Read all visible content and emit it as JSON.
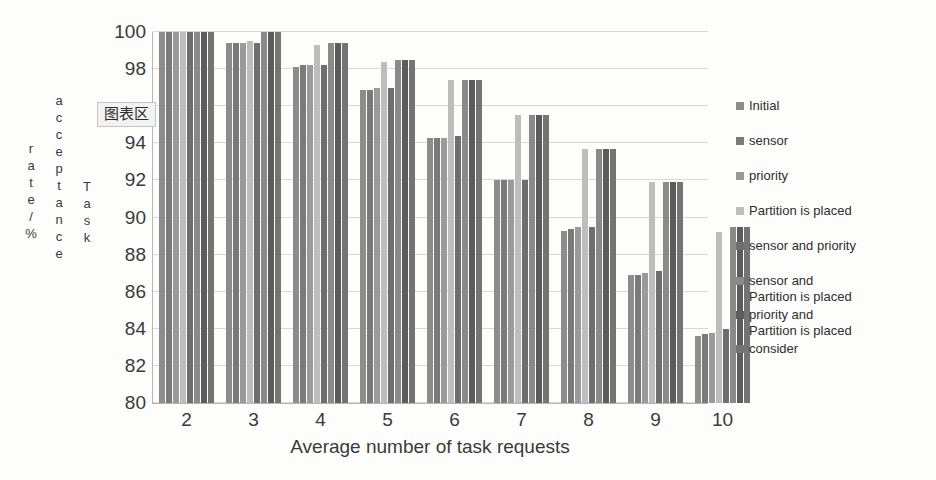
{
  "chart_data": {
    "type": "bar",
    "title": "",
    "xlabel": "Average number of task requests",
    "ylabel": "Task acceptance rate/%",
    "ylabel_parts": [
      "rate/%",
      "acceptance",
      "Task"
    ],
    "categories": [
      "2",
      "3",
      "4",
      "5",
      "6",
      "7",
      "8",
      "9",
      "10"
    ],
    "ylim": [
      80,
      100
    ],
    "yticks": [
      80,
      82,
      84,
      86,
      88,
      90,
      92,
      94,
      96,
      98,
      100
    ],
    "ytick_labels": [
      "80",
      "82",
      "84",
      "86",
      "88",
      "90",
      "92",
      "94",
      "",
      "98",
      "100"
    ],
    "grid": true,
    "legend_position": "right",
    "series": [
      {
        "name": "Initial",
        "color": "#8c8c8c",
        "values": [
          100,
          99.4,
          98.1,
          96.9,
          94.3,
          92.0,
          89.3,
          86.9,
          83.6
        ]
      },
      {
        "name": "sensor",
        "color": "#7a7a7a",
        "values": [
          100,
          99.4,
          98.2,
          96.9,
          94.3,
          92.0,
          89.4,
          86.9,
          83.7
        ]
      },
      {
        "name": "priority",
        "color": "#9a9a9a",
        "values": [
          100,
          99.4,
          98.2,
          97.0,
          94.3,
          92.0,
          89.5,
          87.0,
          83.8
        ]
      },
      {
        "name": "Partition is placed",
        "color": "#bdbdbd",
        "values": [
          100,
          99.5,
          99.3,
          98.4,
          97.4,
          95.5,
          93.7,
          91.9,
          89.2
        ]
      },
      {
        "name": "sensor and priority",
        "color": "#6e6e6e",
        "values": [
          100,
          99.4,
          98.2,
          97.0,
          94.4,
          92.0,
          89.5,
          87.1,
          84.0
        ]
      },
      {
        "name": "sensor and\nPartition is placed",
        "color": "#8a8a8a",
        "values": [
          100,
          100,
          99.4,
          98.5,
          97.4,
          95.5,
          93.7,
          91.9,
          89.5
        ]
      },
      {
        "name": "priority and\nPartition is placed",
        "color": "#5c5c5c",
        "values": [
          100,
          100,
          99.4,
          98.5,
          97.4,
          95.5,
          93.7,
          91.9,
          89.5
        ]
      },
      {
        "name": "consider",
        "color": "#747474",
        "values": [
          100,
          100,
          99.4,
          98.5,
          97.4,
          95.5,
          93.7,
          91.9,
          89.5
        ]
      }
    ]
  },
  "overlay": {
    "chart_area_tooltip": "图表区"
  }
}
